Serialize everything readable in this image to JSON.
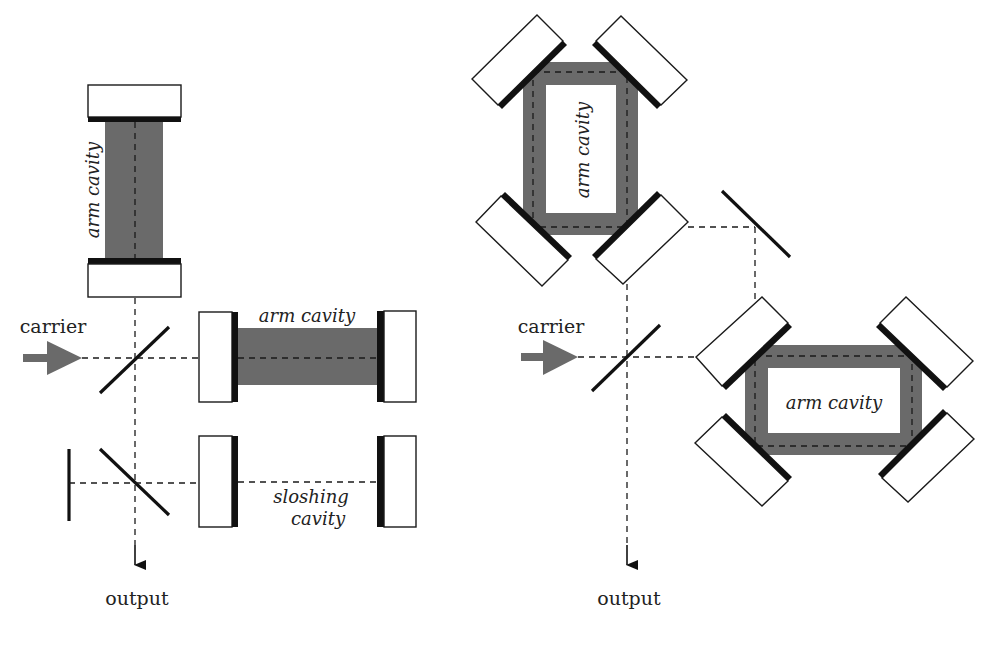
{
  "left_diagram": {
    "carrier_label": "carrier",
    "output_label": "output",
    "vertical_arm_label": "arm cavity",
    "horizontal_arm_label": "arm cavity",
    "sloshing_label_line1": "sloshing",
    "sloshing_label_line2": "cavity"
  },
  "right_diagram": {
    "carrier_label": "carrier",
    "output_label": "output",
    "upper_ring_label": "arm cavity",
    "lower_ring_label": "arm cavity"
  },
  "colors": {
    "beam": "#6a6a6a",
    "coating": "#111111",
    "mirror_fill": "#ffffff",
    "line": "#1a1a1a"
  }
}
